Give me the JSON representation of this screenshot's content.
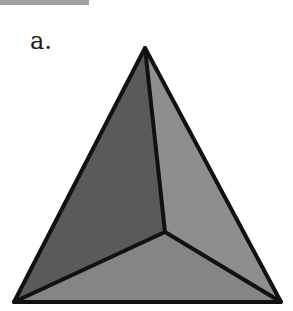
{
  "figure": {
    "label": "a.",
    "top_bar_color": "#a0a0a0",
    "shape": "tetrahedron",
    "vertices": {
      "apex": [
        145,
        48
      ],
      "center": [
        165,
        232
      ],
      "bottom_left": [
        14,
        302
      ],
      "bottom_right": [
        281,
        302
      ]
    },
    "faces": [
      {
        "name": "left-face",
        "color": "#5a5a5a"
      },
      {
        "name": "right-face",
        "color": "#8e8e8e"
      },
      {
        "name": "bottom-face",
        "color": "#858585"
      }
    ],
    "edge_color": "#111111",
    "edge_width": 4
  }
}
